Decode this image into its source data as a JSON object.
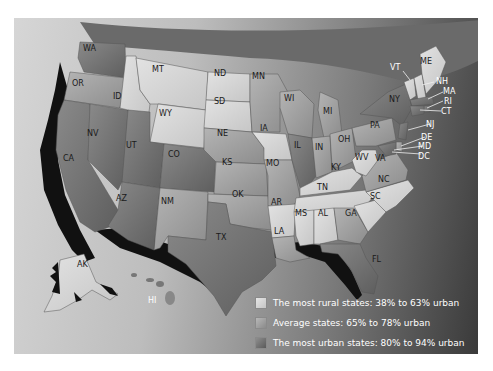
{
  "map": {
    "title": "",
    "subject": "Percent urban population by state",
    "colors": {
      "rural": "#d9d9d9",
      "average": "#a8a8a8",
      "urban": "#7a7a7a",
      "coast_shadow": "#111111",
      "ocean_dark": "#333333"
    },
    "states": [
      {
        "abbr": "WA",
        "category": "urban"
      },
      {
        "abbr": "OR",
        "category": "average"
      },
      {
        "abbr": "CA",
        "category": "urban"
      },
      {
        "abbr": "NV",
        "category": "urban"
      },
      {
        "abbr": "ID",
        "category": "rural"
      },
      {
        "abbr": "MT",
        "category": "rural"
      },
      {
        "abbr": "WY",
        "category": "rural"
      },
      {
        "abbr": "UT",
        "category": "urban"
      },
      {
        "abbr": "CO",
        "category": "urban"
      },
      {
        "abbr": "AZ",
        "category": "urban"
      },
      {
        "abbr": "NM",
        "category": "average"
      },
      {
        "abbr": "ND",
        "category": "rural"
      },
      {
        "abbr": "SD",
        "category": "rural"
      },
      {
        "abbr": "NE",
        "category": "average"
      },
      {
        "abbr": "KS",
        "category": "average"
      },
      {
        "abbr": "OK",
        "category": "average"
      },
      {
        "abbr": "TX",
        "category": "urban"
      },
      {
        "abbr": "MN",
        "category": "average"
      },
      {
        "abbr": "IA",
        "category": "rural"
      },
      {
        "abbr": "MO",
        "category": "average"
      },
      {
        "abbr": "AR",
        "category": "rural"
      },
      {
        "abbr": "LA",
        "category": "average"
      },
      {
        "abbr": "WI",
        "category": "average"
      },
      {
        "abbr": "IL",
        "category": "urban"
      },
      {
        "abbr": "MI",
        "category": "average"
      },
      {
        "abbr": "IN",
        "category": "average"
      },
      {
        "abbr": "OH",
        "category": "average"
      },
      {
        "abbr": "KY",
        "category": "rural"
      },
      {
        "abbr": "TN",
        "category": "rural"
      },
      {
        "abbr": "MS",
        "category": "rural"
      },
      {
        "abbr": "AL",
        "category": "rural"
      },
      {
        "abbr": "GA",
        "category": "average"
      },
      {
        "abbr": "FL",
        "category": "urban"
      },
      {
        "abbr": "SC",
        "category": "rural"
      },
      {
        "abbr": "NC",
        "category": "rural"
      },
      {
        "abbr": "VA",
        "category": "average"
      },
      {
        "abbr": "WV",
        "category": "rural"
      },
      {
        "abbr": "PA",
        "category": "average"
      },
      {
        "abbr": "NY",
        "category": "urban"
      },
      {
        "abbr": "VT",
        "category": "rural"
      },
      {
        "abbr": "NH",
        "category": "rural"
      },
      {
        "abbr": "ME",
        "category": "rural"
      },
      {
        "abbr": "MA",
        "category": "urban"
      },
      {
        "abbr": "RI",
        "category": "urban"
      },
      {
        "abbr": "CT",
        "category": "urban"
      },
      {
        "abbr": "NJ",
        "category": "urban"
      },
      {
        "abbr": "DE",
        "category": "average"
      },
      {
        "abbr": "MD",
        "category": "urban"
      },
      {
        "abbr": "DC",
        "category": "urban"
      },
      {
        "abbr": "AK",
        "category": "rural"
      },
      {
        "abbr": "HI",
        "category": "urban"
      }
    ],
    "labels": {
      "WA": "WA",
      "OR": "OR",
      "CA": "CA",
      "NV": "NV",
      "ID": "ID",
      "MT": "MT",
      "WY": "WY",
      "UT": "UT",
      "CO": "CO",
      "AZ": "AZ",
      "NM": "NM",
      "ND": "ND",
      "SD": "SD",
      "NE": "NE",
      "KS": "KS",
      "OK": "OK",
      "TX": "TX",
      "MN": "MN",
      "IA": "IA",
      "MO": "MO",
      "AR": "AR",
      "LA": "LA",
      "WI": "WI",
      "IL": "IL",
      "MI": "MI",
      "IN": "IN",
      "OH": "OH",
      "KY": "KY",
      "TN": "TN",
      "MS": "MS",
      "AL": "AL",
      "GA": "GA",
      "FL": "FL",
      "SC": "SC",
      "NC": "NC",
      "VA": "VA",
      "WV": "WV",
      "PA": "PA",
      "NY": "NY",
      "VT": "VT",
      "NH": "NH",
      "ME": "ME",
      "MA": "MA",
      "RI": "RI",
      "CT": "CT",
      "NJ": "NJ",
      "DE": "DE",
      "MD": "MD",
      "DC": "DC",
      "AK": "AK",
      "HI": "HI"
    }
  },
  "legend": {
    "items": [
      {
        "label": "The most rural states: 38% to 63% urban",
        "color": "#d9d9d9"
      },
      {
        "label": "Average states: 65% to 78% urban",
        "color": "#a8a8a8"
      },
      {
        "label": "The most urban states: 80% to 94% urban",
        "color": "#7a7a7a"
      }
    ]
  }
}
